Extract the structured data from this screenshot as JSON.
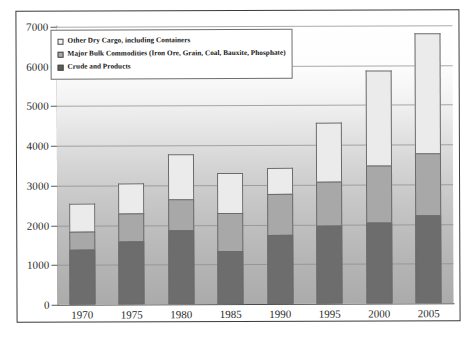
{
  "chart_data": {
    "type": "bar",
    "stacked": true,
    "title": "",
    "subtitle": "",
    "xlabel": "",
    "ylabel": "",
    "categories": [
      "1970",
      "1975",
      "1980",
      "1985",
      "1990",
      "1995",
      "2000",
      "2005"
    ],
    "ylim": [
      0,
      7000
    ],
    "ytick_labels": [
      "0",
      "1000",
      "2000",
      "3000",
      "4000",
      "5000",
      "6000",
      "7000"
    ],
    "ytick_values": [
      0,
      1000,
      2000,
      3000,
      4000,
      5000,
      6000,
      7000
    ],
    "grid": true,
    "legend_position": "top-left-inside",
    "series": [
      {
        "name": "Crude and Products",
        "color": "#6d6d6d",
        "values": [
          1390,
          1590,
          1870,
          1330,
          1740,
          1960,
          2040,
          2215
        ]
      },
      {
        "name": "Major Bulk Commodities (Iron Ore, Grain, Coal, Bauxite, Phosphate)",
        "color": "#a8a8a8",
        "values": [
          450,
          700,
          780,
          960,
          1030,
          1110,
          1440,
          1565
        ]
      },
      {
        "name": "Other Dry Cargo, including Containers",
        "color": "#ebebeb",
        "values": [
          700,
          760,
          1120,
          1010,
          660,
          1490,
          2390,
          3020
        ]
      }
    ],
    "totals": [
      2540,
      3050,
      3770,
      3300,
      3430,
      4560,
      5870,
      6800
    ]
  },
  "legend": {
    "items": [
      {
        "label": "Other Dry Cargo, including Containers",
        "swatch": "sw-other"
      },
      {
        "label": "Major Bulk Commodities (Iron Ore, Grain, Coal, Bauxite, Phosphate)",
        "swatch": "sw-bulk"
      },
      {
        "label": "Crude and Products",
        "swatch": "sw-crude"
      }
    ]
  }
}
